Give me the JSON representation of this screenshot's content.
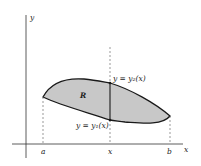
{
  "diagram": {
    "type": "region-between-curves",
    "axes": {
      "x_label": "x",
      "y_label": "y"
    },
    "ticks": {
      "a": "a",
      "x": "x",
      "b": "b"
    },
    "region_label": "R",
    "upper_curve_label": "y = y₂(x)",
    "lower_curve_label": "y = y₁(x)",
    "colors": {
      "region_fill": "#c8c8c8",
      "curve_stroke": "#1a1a1a",
      "axis_stroke": "#333333",
      "dashed_stroke": "#555555"
    }
  }
}
